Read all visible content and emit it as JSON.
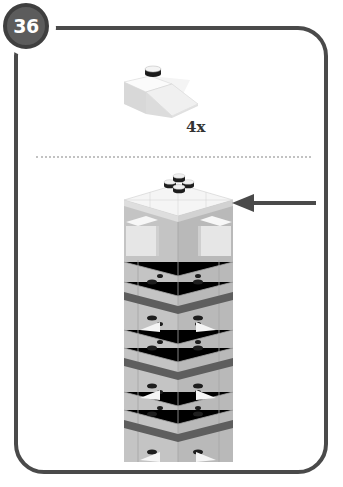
{
  "page": {
    "step_number": "36",
    "parts_callout": {
      "part_name": "slope brick 2x2 45°",
      "part_icon": "slope-brick-icon",
      "quantity": "4x"
    },
    "assembly_view": {
      "model": "tower",
      "pointer": "arrow-left-icon"
    }
  },
  "colors": {
    "frame": "#4a4a4a",
    "badge": "#5c5c5c",
    "brick_light": "#e8e8e8",
    "brick_mid": "#bdbdbd",
    "brick_dark": "#9e9e9e",
    "stripe": "#5e5e5e",
    "arrow": "#4a4a4a"
  }
}
